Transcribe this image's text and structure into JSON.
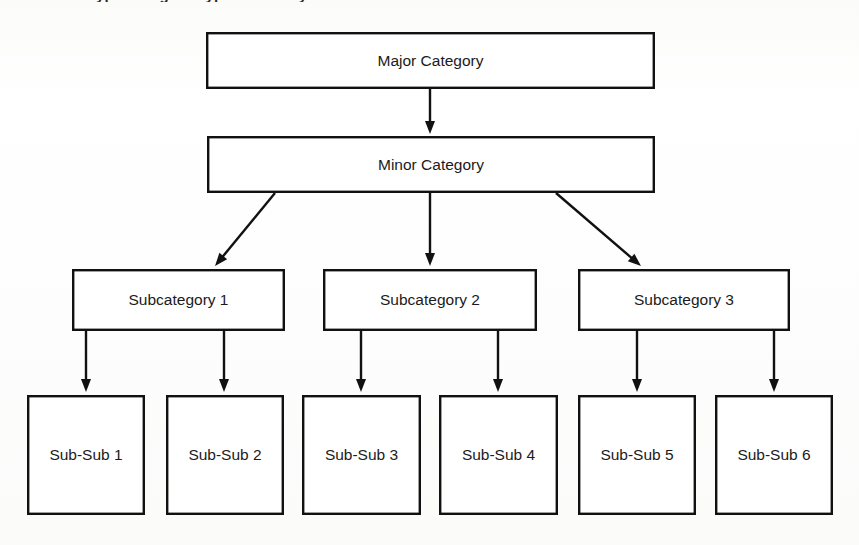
{
  "page": {
    "width": 859,
    "height": 545,
    "background_color": "#fdfdfc",
    "line_color": "#111111",
    "text_color": "#1b1b1b",
    "box_fill": "#ffffff",
    "title_fragment": "ypical Higher Type Hierarchy"
  },
  "diagram": {
    "type": "hierarchy-tree",
    "levels": [
      {
        "level": 1,
        "nodes": [
          {
            "id": "major",
            "label": "Major Category",
            "x": 206,
            "y": 32,
            "w": 449,
            "h": 57
          }
        ]
      },
      {
        "level": 2,
        "nodes": [
          {
            "id": "minor",
            "label": "Minor Category",
            "x": 207,
            "y": 136,
            "w": 448,
            "h": 57
          }
        ]
      },
      {
        "level": 3,
        "nodes": [
          {
            "id": "sub1",
            "label": "Subcategory 1",
            "x": 72,
            "y": 269,
            "w": 213,
            "h": 62
          },
          {
            "id": "sub2",
            "label": "Subcategory 2",
            "x": 323,
            "y": 269,
            "w": 214,
            "h": 62
          },
          {
            "id": "sub3",
            "label": "Subcategory 3",
            "x": 578,
            "y": 269,
            "w": 212,
            "h": 62
          }
        ]
      },
      {
        "level": 4,
        "nodes": [
          {
            "id": "ss1",
            "label": "Sub-Sub 1",
            "x": 27,
            "y": 395,
            "w": 118,
            "h": 120
          },
          {
            "id": "ss2",
            "label": "Sub-Sub 2",
            "x": 166,
            "y": 395,
            "w": 118,
            "h": 120
          },
          {
            "id": "ss3",
            "label": "Sub-Sub 3",
            "x": 302,
            "y": 395,
            "w": 119,
            "h": 120
          },
          {
            "id": "ss4",
            "label": "Sub-Sub 4",
            "x": 439,
            "y": 395,
            "w": 119,
            "h": 120
          },
          {
            "id": "ss5",
            "label": "Sub-Sub 5",
            "x": 578,
            "y": 395,
            "w": 118,
            "h": 120
          },
          {
            "id": "ss6",
            "label": "Sub-Sub 6",
            "x": 715,
            "y": 395,
            "w": 118,
            "h": 120
          }
        ]
      }
    ],
    "edges": [
      {
        "id": "e-major-minor",
        "from": "major",
        "to": "minor",
        "kind": "vertical",
        "x1": 430,
        "y1": 89,
        "x2": 430,
        "y2": 134
      },
      {
        "id": "e-minor-sub1",
        "from": "minor",
        "to": "sub1",
        "kind": "diagonal",
        "x1": 275,
        "y1": 193,
        "x2": 215,
        "y2": 266
      },
      {
        "id": "e-minor-sub2",
        "from": "minor",
        "to": "sub2",
        "kind": "vertical",
        "x1": 430,
        "y1": 193,
        "x2": 430,
        "y2": 266
      },
      {
        "id": "e-minor-sub3",
        "from": "minor",
        "to": "sub3",
        "kind": "diagonal",
        "x1": 556,
        "y1": 193,
        "x2": 641,
        "y2": 266
      },
      {
        "id": "e-sub1-ss1",
        "from": "sub1",
        "to": "ss1",
        "kind": "vertical",
        "x1": 86,
        "y1": 331,
        "x2": 86,
        "y2": 392
      },
      {
        "id": "e-sub1-ss2",
        "from": "sub1",
        "to": "ss2",
        "kind": "vertical",
        "x1": 224,
        "y1": 331,
        "x2": 224,
        "y2": 392
      },
      {
        "id": "e-sub2-ss3",
        "from": "sub2",
        "to": "ss3",
        "kind": "vertical",
        "x1": 361,
        "y1": 331,
        "x2": 361,
        "y2": 392
      },
      {
        "id": "e-sub2-ss4",
        "from": "sub2",
        "to": "ss4",
        "kind": "vertical",
        "x1": 498,
        "y1": 331,
        "x2": 498,
        "y2": 392
      },
      {
        "id": "e-sub3-ss5",
        "from": "sub3",
        "to": "ss5",
        "kind": "vertical",
        "x1": 637,
        "y1": 331,
        "x2": 637,
        "y2": 392
      },
      {
        "id": "e-sub3-ss6",
        "from": "sub3",
        "to": "ss6",
        "kind": "vertical",
        "x1": 774,
        "y1": 331,
        "x2": 774,
        "y2": 392
      }
    ]
  }
}
